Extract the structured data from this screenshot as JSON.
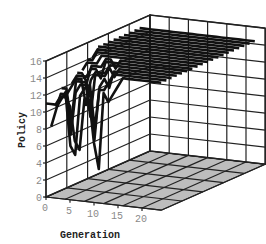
{
  "chart_data": {
    "type": "line3d",
    "title": "",
    "xlabel": "Generation",
    "ylabel": "Policy",
    "zlabel": "",
    "x_ticks": [
      "0",
      "5",
      "10",
      "15",
      "20"
    ],
    "y_ticks": [
      "0",
      "2",
      "4",
      "6",
      "8",
      "10",
      "12",
      "14",
      "16"
    ],
    "xlim": [
      0,
      24
    ],
    "ylim": [
      0,
      16
    ],
    "grid": true,
    "legend": null,
    "colors": {
      "lines": "#111111",
      "floor": "#bdbdbd",
      "grid": "#222222",
      "tick": "#8a8a8a"
    },
    "x": [
      0,
      1,
      2,
      3,
      4,
      5,
      6,
      7,
      8,
      9,
      10,
      11,
      12,
      13,
      14,
      15,
      16,
      17,
      18,
      19,
      20,
      21,
      22,
      23,
      24
    ],
    "series": [
      {
        "name": "run-1",
        "depth": 0.0,
        "values": [
          11,
          11,
          11,
          12,
          12,
          11,
          7,
          6,
          12,
          12,
          7,
          4,
          13,
          12,
          13,
          14,
          15,
          15,
          15,
          15,
          15,
          15,
          15,
          15,
          15
        ]
      },
      {
        "name": "run-2",
        "depth": 0.05,
        "values": [
          8,
          10,
          12,
          12,
          6,
          5,
          12,
          13,
          13,
          7,
          13,
          13,
          14,
          15,
          15,
          15,
          15,
          15,
          15,
          15,
          15,
          15,
          15,
          15,
          15
        ]
      },
      {
        "name": "run-3",
        "depth": 0.1,
        "values": [
          10,
          11,
          12,
          7,
          12,
          13,
          13,
          13,
          8,
          13,
          14,
          13,
          15,
          15,
          15,
          15,
          15,
          15,
          15,
          15,
          15,
          15,
          15,
          15,
          15
        ]
      },
      {
        "name": "run-4",
        "depth": 0.15,
        "values": [
          12,
          12,
          8,
          13,
          13,
          13,
          9,
          14,
          14,
          14,
          15,
          14,
          15,
          15,
          15,
          15,
          15,
          15,
          15,
          15,
          15,
          15,
          15,
          15,
          15
        ]
      },
      {
        "name": "run-5",
        "depth": 0.2,
        "values": [
          11,
          12,
          13,
          13,
          10,
          13,
          14,
          14,
          14,
          15,
          15,
          15,
          15,
          15,
          15,
          15,
          15,
          15,
          15,
          15,
          15,
          15,
          15,
          15,
          15
        ]
      },
      {
        "name": "run-6",
        "depth": 0.25,
        "values": [
          12,
          13,
          13,
          13,
          14,
          14,
          13,
          15,
          15,
          15,
          15,
          15,
          15,
          15,
          15,
          15,
          15,
          15,
          15,
          15,
          15,
          15,
          15,
          15,
          15
        ]
      },
      {
        "name": "run-7",
        "depth": 0.3,
        "values": [
          13,
          13,
          12,
          14,
          14,
          14,
          15,
          15,
          14,
          15,
          15,
          15,
          15,
          15,
          15,
          15,
          15,
          15,
          15,
          15,
          15,
          15,
          15,
          15,
          15
        ]
      },
      {
        "name": "run-8",
        "depth": 0.35,
        "values": [
          13,
          14,
          14,
          14,
          15,
          15,
          15,
          15,
          15,
          15,
          15,
          15,
          15,
          15,
          15,
          15,
          15,
          15,
          15,
          15,
          15,
          15,
          15,
          15,
          15
        ]
      },
      {
        "name": "run-9",
        "depth": 0.4,
        "values": [
          14,
          14,
          15,
          15,
          15,
          15,
          15,
          15,
          15,
          15,
          15,
          15,
          15,
          15,
          15,
          15,
          15,
          15,
          15,
          15,
          15,
          15,
          15,
          15,
          15
        ]
      },
      {
        "name": "run-10",
        "depth": 0.45,
        "values": [
          14,
          15,
          15,
          15,
          15,
          15,
          15,
          15,
          15,
          15,
          15,
          15,
          15,
          15,
          15,
          15,
          15,
          15,
          15,
          15,
          15,
          15,
          15,
          15,
          15
        ]
      },
      {
        "name": "run-11",
        "depth": 0.5,
        "values": [
          15,
          15,
          15,
          15,
          15,
          15,
          15,
          15,
          15,
          15,
          15,
          15,
          15,
          15,
          15,
          15,
          15,
          15,
          15,
          15,
          15,
          15,
          15,
          15,
          15
        ]
      },
      {
        "name": "run-12",
        "depth": 0.55,
        "values": [
          15,
          15,
          15,
          15,
          15,
          15,
          15,
          15,
          15,
          15,
          15,
          15,
          15,
          15,
          15,
          15,
          15,
          15,
          15,
          15,
          15,
          15,
          15,
          15,
          15
        ]
      },
      {
        "name": "run-13",
        "depth": 0.6,
        "values": [
          15,
          15,
          15,
          15,
          15,
          15,
          15,
          15,
          15,
          15,
          15,
          15,
          15,
          15,
          15,
          15,
          15,
          15,
          15,
          15,
          15,
          15,
          15,
          15,
          15
        ]
      },
      {
        "name": "run-14",
        "depth": 0.65,
        "values": [
          15,
          15,
          15,
          15,
          15,
          15,
          15,
          15,
          15,
          15,
          15,
          15,
          15,
          15,
          15,
          15,
          15,
          15,
          15,
          15,
          15,
          15,
          15,
          15,
          15
        ]
      },
      {
        "name": "run-15",
        "depth": 0.7,
        "values": [
          15,
          15,
          15,
          15,
          15,
          15,
          15,
          15,
          15,
          15,
          15,
          15,
          15,
          15,
          15,
          15,
          15,
          15,
          15,
          15,
          15,
          15,
          15,
          15,
          15
        ]
      },
      {
        "name": "run-16",
        "depth": 0.75,
        "values": [
          15,
          15,
          15,
          15,
          15,
          15,
          15,
          15,
          15,
          15,
          15,
          15,
          15,
          15,
          15,
          15,
          15,
          15,
          15,
          15,
          15,
          15,
          15,
          15,
          15
        ]
      },
      {
        "name": "run-17",
        "depth": 0.8,
        "values": [
          15,
          15,
          15,
          15,
          15,
          15,
          15,
          15,
          15,
          15,
          15,
          15,
          15,
          15,
          15,
          15,
          15,
          15,
          15,
          15,
          15,
          15,
          15,
          15,
          15
        ]
      },
      {
        "name": "run-18",
        "depth": 0.85,
        "values": [
          15,
          15,
          15,
          15,
          15,
          15,
          15,
          15,
          15,
          15,
          15,
          15,
          15,
          15,
          15,
          15,
          15,
          15,
          15,
          15,
          15,
          15,
          15,
          15,
          15
        ]
      },
      {
        "name": "run-19",
        "depth": 0.9,
        "values": [
          15,
          15,
          15,
          15,
          15,
          15,
          15,
          15,
          15,
          15,
          15,
          15,
          15,
          15,
          15,
          15,
          15,
          15,
          15,
          15,
          15,
          15,
          15,
          15,
          15
        ]
      }
    ]
  }
}
